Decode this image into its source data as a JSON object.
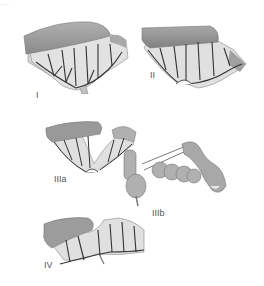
{
  "corner_text": "......",
  "figures": [
    {
      "id": "I",
      "label": "I"
    },
    {
      "id": "II",
      "label": "II"
    },
    {
      "id": "IIIa",
      "label": "IIIa"
    },
    {
      "id": "IIIb",
      "label": "IIIb"
    },
    {
      "id": "IV",
      "label": "IV"
    }
  ],
  "colors": {
    "bowel_fill": "#9a9a9a",
    "bowel_light": "#c8c8c8",
    "mesentery": "#dcdcdc",
    "vessel": "#333333",
    "label": "#555555"
  }
}
